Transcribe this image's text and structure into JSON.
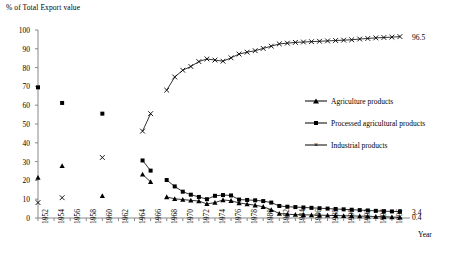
{
  "chart_data": {
    "type": "line",
    "title": "% of Total Export value",
    "xlabel": "Year",
    "ylabel": "% of Total Export value",
    "xlim": [
      1952,
      1998
    ],
    "ylim": [
      0,
      100
    ],
    "yticks": [
      0,
      10,
      20,
      30,
      40,
      50,
      60,
      70,
      80,
      90,
      100
    ],
    "xticks": [
      1952,
      1954,
      1956,
      1958,
      1960,
      1962,
      1964,
      1966,
      1968,
      1970,
      1972,
      1974,
      1976,
      1978,
      1980,
      1982,
      1984,
      1986,
      1988,
      1990,
      1992,
      1994,
      1996
    ],
    "grid": false,
    "legend_position": "right-middle",
    "end_labels": [
      {
        "text": "96.5",
        "series": "Industrial products",
        "value": 96.5
      },
      {
        "text": "3.4",
        "series": "Processed agricultural products",
        "value": 3.4
      },
      {
        "text": "0.4",
        "series": "Agriculture products",
        "value": 0.4
      }
    ],
    "series": [
      {
        "name": "Agriculture products",
        "marker": "triangle",
        "x": [
          1952,
          1955,
          1960,
          1965,
          1966,
          1968,
          1969,
          1970,
          1971,
          1972,
          1973,
          1974,
          1975,
          1976,
          1977,
          1978,
          1979,
          1980,
          1981,
          1982,
          1983,
          1984,
          1985,
          1986,
          1987,
          1988,
          1989,
          1990,
          1991,
          1992,
          1993,
          1994,
          1995,
          1996,
          1997
        ],
        "y": [
          21.5,
          27.8,
          11.8,
          23.2,
          19.2,
          11.2,
          10.2,
          9.8,
          9.4,
          9.0,
          7.5,
          8.2,
          9.6,
          9.2,
          8.0,
          7.4,
          6.8,
          6.0,
          4.4,
          2.4,
          2.0,
          1.8,
          1.7,
          1.6,
          1.5,
          1.4,
          1.3,
          1.2,
          1.1,
          1.0,
          0.9,
          0.8,
          0.7,
          0.5,
          0.4
        ]
      },
      {
        "name": "Processed agricultural products",
        "marker": "square",
        "x": [
          1952,
          1955,
          1960,
          1965,
          1966,
          1968,
          1969,
          1970,
          1971,
          1972,
          1973,
          1974,
          1975,
          1976,
          1977,
          1978,
          1979,
          1980,
          1981,
          1982,
          1983,
          1984,
          1985,
          1986,
          1987,
          1988,
          1989,
          1990,
          1991,
          1992,
          1993,
          1994,
          1995,
          1996,
          1997
        ],
        "y": [
          69.5,
          61.2,
          55.5,
          30.6,
          25.2,
          20.2,
          16.8,
          14.0,
          12.4,
          11.2,
          10.0,
          11.8,
          12.2,
          12.0,
          9.8,
          9.6,
          9.4,
          9.0,
          8.2,
          6.4,
          6.0,
          5.8,
          5.6,
          5.4,
          5.2,
          5.0,
          4.8,
          4.6,
          4.4,
          4.2,
          4.0,
          3.8,
          3.6,
          3.5,
          3.4
        ]
      },
      {
        "name": "Industrial products",
        "marker": "cross",
        "x": [
          1952,
          1955,
          1960,
          1965,
          1966,
          1968,
          1969,
          1970,
          1971,
          1972,
          1973,
          1974,
          1975,
          1976,
          1977,
          1978,
          1979,
          1980,
          1981,
          1982,
          1983,
          1984,
          1985,
          1986,
          1987,
          1988,
          1989,
          1990,
          1991,
          1992,
          1993,
          1994,
          1995,
          1996,
          1997
        ],
        "y": [
          8.2,
          10.8,
          32.2,
          46.2,
          55.5,
          68.0,
          75.0,
          78.6,
          80.6,
          83.2,
          84.6,
          84.0,
          83.4,
          85.2,
          87.2,
          88.2,
          89.0,
          90.2,
          91.4,
          92.6,
          93.0,
          93.4,
          93.6,
          93.8,
          94.0,
          94.2,
          94.4,
          94.6,
          94.8,
          95.2,
          95.5,
          95.8,
          96.0,
          96.2,
          96.5
        ]
      }
    ]
  },
  "legend": {
    "items": [
      {
        "label": "Agriculture products",
        "marker": "triangle"
      },
      {
        "label": "Processed agricultural products",
        "marker": "square"
      },
      {
        "label": "Industrial products",
        "marker": "cross"
      }
    ]
  }
}
